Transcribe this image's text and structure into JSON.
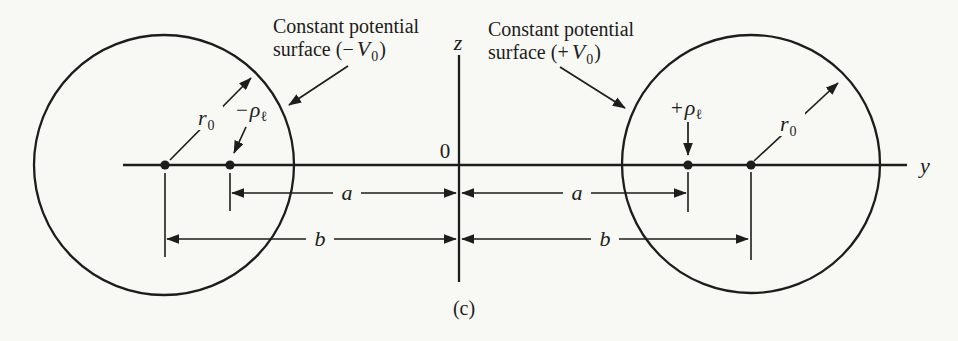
{
  "colors": {
    "paper": "#f8f8f5",
    "ink": "#1d1d1b"
  },
  "caption": "(c)",
  "axes": {
    "vertical_label": "z",
    "horizontal_label": "y",
    "origin_label": "0"
  },
  "left": {
    "annotation_line1": "Constant potential",
    "annotation_pre": "surface (−",
    "annotation_var": "V",
    "annotation_sub": "0",
    "annotation_post": ")",
    "radius_var": "r",
    "radius_sub": "0",
    "charge_sign": "−",
    "charge_var": "ρ",
    "charge_sub": "ℓ",
    "dim_inner": "a",
    "dim_outer": "b"
  },
  "right": {
    "annotation_line1": "Constant potential",
    "annotation_pre": "surface (+",
    "annotation_var": "V",
    "annotation_sub": "0",
    "annotation_post": ")",
    "radius_var": "r",
    "radius_sub": "0",
    "charge_sign": "+",
    "charge_var": "ρ",
    "charge_sub": "ℓ",
    "dim_inner": "a",
    "dim_outer": "b"
  }
}
